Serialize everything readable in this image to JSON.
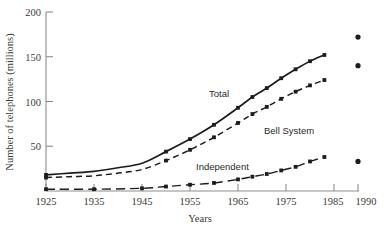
{
  "chart_data": {
    "type": "line",
    "title": "",
    "xlabel": "Years",
    "ylabel": "Number of telephones (millions)",
    "xlim": [
      1925,
      1990
    ],
    "ylim": [
      0,
      200
    ],
    "grid": false,
    "legend": "inline-annotations",
    "x_ticks": [
      1925,
      1935,
      1945,
      1955,
      1965,
      1975,
      1985,
      1990
    ],
    "x_tick_labels": [
      "1925",
      "1935",
      "1945",
      "1955",
      "1965",
      "1975",
      "1985",
      "1990"
    ],
    "y_ticks": [
      0,
      50,
      100,
      150,
      200
    ],
    "y_tick_labels": [
      "",
      "50",
      "100",
      "150",
      "200"
    ],
    "series": [
      {
        "name": "Total",
        "style": "solid",
        "marker": "square",
        "x": [
          1925,
          1930,
          1935,
          1940,
          1945,
          1950,
          1955,
          1960,
          1965,
          1968,
          1971,
          1974,
          1977,
          1980,
          1983
        ],
        "values": [
          18,
          20,
          22,
          26,
          31,
          44,
          58,
          74,
          93,
          105,
          115,
          126,
          136,
          145,
          152
        ]
      },
      {
        "name": "Bell System",
        "style": "dashed",
        "marker": "square",
        "x": [
          1925,
          1930,
          1935,
          1940,
          1945,
          1950,
          1955,
          1960,
          1965,
          1968,
          1971,
          1974,
          1977,
          1980,
          1983
        ],
        "values": [
          15,
          16,
          17,
          20,
          24,
          34,
          46,
          60,
          76,
          86,
          94,
          103,
          111,
          118,
          124
        ]
      },
      {
        "name": "Independent",
        "style": "long-dash",
        "marker": "square",
        "x": [
          1925,
          1935,
          1945,
          1950,
          1955,
          1960,
          1965,
          1968,
          1971,
          1974,
          1977,
          1980,
          1983
        ],
        "values": [
          2,
          2,
          3,
          5,
          7,
          9,
          13,
          16,
          19,
          23,
          27,
          33,
          38
        ]
      }
    ],
    "projected_points": [
      {
        "series": "Total",
        "x": 1990,
        "y": 172
      },
      {
        "series": "Bell System",
        "x": 1990,
        "y": 140
      },
      {
        "series": "Independent",
        "x": 1990,
        "y": 33
      }
    ],
    "annotations": [
      {
        "text": "Total",
        "x": 1967,
        "y": 101
      },
      {
        "text": "Bell System",
        "x": 1974,
        "y": 70
      },
      {
        "text": "Independent",
        "x": 1962,
        "y": 29
      }
    ]
  }
}
